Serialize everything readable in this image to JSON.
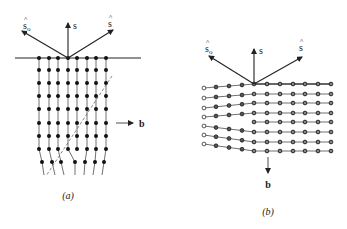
{
  "figure": {
    "panels": [
      {
        "id": "a",
        "caption": "(a)",
        "caption_pos": [
          68,
          199
        ],
        "surface_line": {
          "x1": 15,
          "x2": 141,
          "y": 58
        },
        "origin": [
          68,
          58
        ],
        "vectors": [
          {
            "name": "s_o",
            "label": "s",
            "hat": true,
            "sub": "o",
            "tip": [
              22,
              31
            ],
            "label_pos": [
              23,
              29
            ]
          },
          {
            "name": "s",
            "label": "s",
            "hat": false,
            "sub": "",
            "tip": [
              68,
              23
            ],
            "label_pos": [
              73,
              29
            ]
          },
          {
            "name": "s_hat",
            "label": "s",
            "hat": true,
            "sub": "",
            "tip": [
              113,
              30
            ],
            "label_pos": [
              108,
              27
            ]
          }
        ],
        "lattice": {
          "columns_top": [
            39,
            49,
            58,
            68,
            77,
            87,
            96,
            106
          ],
          "rows_y": [
            58,
            70,
            83,
            96,
            109,
            123,
            136,
            149
          ],
          "bottom_row_y": 162,
          "bottom_row_x": [
            42,
            52,
            61,
            75,
            85,
            95,
            104
          ],
          "tails_end_y": 175,
          "tails_end_x": [
            44,
            55,
            64,
            75,
            84,
            93,
            102
          ],
          "atom_color": "#111111"
        },
        "dashed_line": {
          "x1": 112,
          "y1": 76,
          "x2": 46,
          "y2": 176
        },
        "burgers": {
          "label": "b",
          "x1": 116,
          "y1": 123,
          "x2": 133,
          "y2": 123,
          "label_pos": [
            139,
            127
          ]
        }
      },
      {
        "id": "b",
        "caption": "(b)",
        "caption_pos": [
          268,
          215
        ],
        "origin": [
          254,
          84
        ],
        "vectors": [
          {
            "name": "s_o",
            "label": "s",
            "hat": true,
            "sub": "o",
            "tip": [
              209,
              56
            ],
            "label_pos": [
              205,
              52
            ]
          },
          {
            "name": "s",
            "label": "s",
            "hat": false,
            "sub": "",
            "tip": [
              254,
              49
            ],
            "label_pos": [
              259,
              54
            ]
          },
          {
            "name": "s_hat",
            "label": "s",
            "hat": true,
            "sub": "",
            "tip": [
              302,
              57
            ],
            "label_pos": [
              299,
              51
            ]
          }
        ],
        "lattice": {
          "right_columns": [
            254,
            267,
            280,
            293,
            305,
            318,
            331
          ],
          "right_rows_y": [
            84,
            94,
            103,
            113,
            122,
            132,
            142,
            151
          ],
          "left_columns": [
            204,
            216,
            229,
            242
          ],
          "left_rows": [
            {
              "y_start": 88,
              "joins_right_row": 0
            },
            {
              "y_start": 98,
              "joins_right_row": 1
            },
            {
              "y_start": 108,
              "joins_right_row": 2
            },
            {
              "y_start": 117,
              "joins_right_row": 3
            },
            {
              "y_start": 126,
              "joins_right_row": 5
            },
            {
              "y_start": 135,
              "joins_right_row": 6
            },
            {
              "y_start": 144,
              "joins_right_row": 7
            }
          ],
          "atom_fill": "#555555",
          "atom_stroke": "#111111"
        },
        "burgers": {
          "label": "b",
          "x1": 268,
          "y1": 157,
          "x2": 268,
          "y2": 173,
          "label_pos": [
            268,
            188
          ]
        }
      }
    ]
  }
}
